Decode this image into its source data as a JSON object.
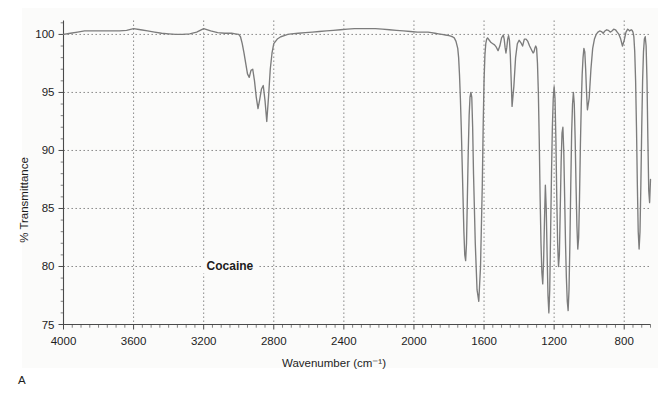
{
  "figure": {
    "panel_letter": "A",
    "background_color": "#ffffff",
    "paper_color": "#fbfbfa"
  },
  "chart_data": {
    "type": "line",
    "title": "",
    "subtitle": "",
    "xlabel": "Wavenumber (cm⁻¹)",
    "ylabel": "% Transmittance",
    "annotations": [
      {
        "text": "Cocaine",
        "x": 3050,
        "y": 80
      }
    ],
    "legend": [],
    "legend_position": "none",
    "grid": true,
    "grid_style": "dotted",
    "xlim": [
      4000,
      650
    ],
    "ylim": [
      75,
      101.2
    ],
    "x_inverted": true,
    "xticks": [
      4000,
      3600,
      3200,
      2800,
      2400,
      2000,
      1600,
      1200,
      800
    ],
    "xtick_labels": [
      "4000",
      "3600",
      "3200",
      "2800",
      "2400",
      "2000",
      "1600",
      "1200",
      "800"
    ],
    "x_minor_tick_step": 50,
    "yticks": [
      75,
      80,
      85,
      90,
      95,
      100
    ],
    "ytick_labels": [
      "75",
      "80",
      "85",
      "90",
      "95",
      "100"
    ],
    "series": [
      {
        "name": "Cocaine",
        "color": "#7c7c7c",
        "x": [
          4000,
          3960,
          3920,
          3880,
          3840,
          3800,
          3760,
          3720,
          3680,
          3640,
          3600,
          3560,
          3520,
          3480,
          3440,
          3400,
          3360,
          3320,
          3280,
          3240,
          3200,
          3160,
          3120,
          3080,
          3060,
          3040,
          3020,
          3000,
          2990,
          2980,
          2970,
          2960,
          2950,
          2940,
          2930,
          2920,
          2910,
          2900,
          2890,
          2880,
          2870,
          2860,
          2850,
          2840,
          2830,
          2820,
          2810,
          2800,
          2780,
          2760,
          2740,
          2720,
          2700,
          2660,
          2620,
          2580,
          2540,
          2500,
          2460,
          2420,
          2380,
          2340,
          2300,
          2260,
          2220,
          2180,
          2140,
          2100,
          2060,
          2020,
          1980,
          1950,
          1920,
          1900,
          1880,
          1860,
          1840,
          1820,
          1800,
          1790,
          1780,
          1770,
          1760,
          1750,
          1745,
          1740,
          1735,
          1730,
          1725,
          1720,
          1715,
          1710,
          1705,
          1700,
          1695,
          1690,
          1685,
          1680,
          1675,
          1670,
          1665,
          1660,
          1650,
          1640,
          1630,
          1620,
          1610,
          1605,
          1600,
          1595,
          1590,
          1585,
          1580,
          1570,
          1560,
          1550,
          1540,
          1530,
          1520,
          1510,
          1500,
          1490,
          1485,
          1480,
          1475,
          1470,
          1465,
          1460,
          1455,
          1450,
          1445,
          1440,
          1430,
          1420,
          1410,
          1400,
          1390,
          1380,
          1375,
          1370,
          1360,
          1350,
          1340,
          1330,
          1320,
          1315,
          1310,
          1305,
          1300,
          1295,
          1290,
          1285,
          1280,
          1275,
          1270,
          1265,
          1260,
          1255,
          1250,
          1245,
          1240,
          1235,
          1230,
          1225,
          1220,
          1215,
          1210,
          1205,
          1200,
          1195,
          1190,
          1185,
          1180,
          1175,
          1170,
          1165,
          1160,
          1155,
          1150,
          1145,
          1140,
          1135,
          1130,
          1125,
          1120,
          1115,
          1110,
          1105,
          1100,
          1095,
          1090,
          1085,
          1080,
          1075,
          1070,
          1065,
          1060,
          1055,
          1050,
          1045,
          1040,
          1035,
          1030,
          1025,
          1020,
          1015,
          1010,
          1000,
          990,
          980,
          970,
          960,
          950,
          940,
          930,
          920,
          910,
          900,
          890,
          880,
          870,
          860,
          850,
          840,
          830,
          820,
          810,
          800,
          790,
          780,
          775,
          770,
          765,
          760,
          755,
          750,
          745,
          740,
          735,
          730,
          725,
          720,
          715,
          710,
          705,
          700,
          695,
          690,
          685,
          680,
          675,
          670,
          665,
          660,
          655,
          650
        ],
        "y": [
          100.0,
          100.1,
          100.2,
          100.3,
          100.3,
          100.3,
          100.3,
          100.3,
          100.3,
          100.35,
          100.5,
          100.4,
          100.3,
          100.2,
          100.1,
          100.05,
          100.0,
          100.0,
          100.05,
          100.2,
          100.5,
          100.3,
          100.15,
          100.1,
          100.1,
          100.1,
          100.05,
          100.0,
          99.8,
          99.2,
          98.4,
          97.5,
          96.6,
          96.3,
          96.9,
          97.0,
          96.0,
          94.6,
          93.6,
          94.4,
          95.3,
          95.6,
          94.3,
          92.5,
          94.6,
          97.0,
          98.4,
          99.2,
          99.6,
          99.8,
          99.9,
          100.0,
          100.05,
          100.1,
          100.15,
          100.2,
          100.25,
          100.3,
          100.35,
          100.4,
          100.45,
          100.5,
          100.5,
          100.5,
          100.5,
          100.45,
          100.4,
          100.35,
          100.3,
          100.25,
          100.2,
          100.2,
          100.2,
          100.15,
          100.1,
          100.05,
          100.0,
          99.95,
          99.9,
          99.85,
          99.8,
          99.7,
          99.4,
          98.8,
          98.0,
          96.5,
          94.5,
          92.0,
          89.0,
          86.0,
          83.0,
          81.0,
          80.5,
          82.0,
          86.0,
          90.0,
          93.0,
          94.6,
          95.0,
          94.6,
          92.0,
          88.0,
          82.0,
          78.0,
          77.0,
          80.0,
          87.0,
          92.0,
          96.0,
          98.2,
          99.2,
          99.6,
          99.7,
          99.5,
          99.3,
          99.2,
          99.1,
          98.9,
          98.6,
          99.0,
          99.7,
          99.95,
          99.6,
          98.9,
          98.4,
          98.9,
          99.6,
          99.9,
          99.5,
          98.2,
          96.0,
          93.8,
          95.5,
          98.0,
          99.2,
          99.5,
          99.3,
          99.0,
          99.3,
          99.6,
          99.6,
          99.4,
          99.0,
          98.7,
          98.4,
          98.5,
          98.8,
          99.0,
          98.8,
          97.5,
          95.0,
          91.0,
          86.0,
          82.0,
          79.5,
          78.5,
          80.5,
          84.0,
          87.0,
          85.0,
          81.0,
          77.5,
          76.0,
          78.0,
          83.0,
          88.0,
          92.0,
          94.5,
          95.5,
          94.5,
          91.0,
          86.0,
          82.0,
          80.0,
          81.0,
          85.0,
          89.0,
          91.5,
          92.0,
          90.0,
          86.0,
          82.0,
          79.0,
          77.0,
          76.2,
          78.0,
          82.0,
          87.0,
          91.5,
          94.0,
          95.0,
          94.0,
          91.0,
          87.0,
          83.5,
          81.5,
          82.5,
          86.0,
          90.5,
          94.0,
          96.5,
          98.0,
          98.8,
          98.5,
          97.0,
          95.0,
          93.5,
          94.5,
          97.0,
          98.8,
          99.6,
          100.0,
          100.2,
          100.3,
          100.25,
          100.1,
          100.3,
          100.4,
          100.35,
          100.2,
          100.3,
          100.45,
          100.4,
          100.2,
          100.0,
          99.6,
          99.0,
          99.5,
          100.2,
          100.45,
          100.4,
          100.3,
          100.35,
          100.4,
          100.35,
          100.2,
          99.8,
          98.5,
          96.0,
          92.0,
          87.0,
          83.0,
          81.5,
          83.0,
          87.0,
          92.0,
          96.0,
          98.5,
          99.6,
          99.8,
          99.0,
          96.0,
          91.0,
          86.5,
          85.5,
          87.5
        ]
      }
    ]
  },
  "axes": {
    "y_axis_title": "% Transmittance",
    "x_axis_title": "Wavenumber (cm⁻¹)"
  }
}
